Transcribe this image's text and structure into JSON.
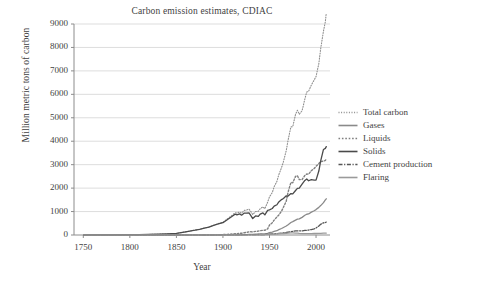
{
  "chart_data": {
    "type": "line",
    "title": "Carbon emission estimates, CDIAC",
    "xlabel": "Year",
    "ylabel": "Million metric tons of carbon",
    "xlim": [
      1740,
      2015
    ],
    "ylim": [
      0,
      9000
    ],
    "grid": "horizontal",
    "legend_position": "right",
    "xticks": [
      "1750",
      "1800",
      "1850",
      "1900",
      "1950",
      "2000"
    ],
    "xtick_values": [
      1750,
      1800,
      1850,
      1900,
      1950,
      2000
    ],
    "yticks": [
      "0",
      "1000",
      "2000",
      "3000",
      "4000",
      "5000",
      "6000",
      "7000",
      "8000",
      "9000"
    ],
    "ytick_values": [
      0,
      1000,
      2000,
      3000,
      4000,
      5000,
      6000,
      7000,
      8000,
      9000
    ],
    "x": [
      1751,
      1760,
      1770,
      1780,
      1790,
      1800,
      1810,
      1820,
      1830,
      1840,
      1850,
      1860,
      1870,
      1875,
      1880,
      1885,
      1890,
      1895,
      1900,
      1905,
      1910,
      1913,
      1915,
      1918,
      1920,
      1923,
      1925,
      1928,
      1930,
      1932,
      1935,
      1938,
      1940,
      1943,
      1945,
      1948,
      1950,
      1953,
      1955,
      1958,
      1960,
      1963,
      1965,
      1968,
      1970,
      1973,
      1975,
      1978,
      1980,
      1982,
      1985,
      1988,
      1990,
      1992,
      1995,
      1998,
      2000,
      2003,
      2005,
      2008,
      2010,
      2011
    ],
    "series": [
      {
        "name": "Total carbon",
        "style": "fine-dotted",
        "color": "#8f8f8f",
        "values": [
          3,
          4,
          6,
          8,
          10,
          12,
          17,
          23,
          31,
          45,
          65,
          135,
          205,
          245,
          295,
          345,
          415,
          485,
          545,
          695,
          845,
          950,
          930,
          980,
          935,
          1050,
          1060,
          1105,
          1000,
          870,
          1000,
          1010,
          1120,
          1200,
          1120,
          1400,
          1630,
          1810,
          2060,
          2290,
          2570,
          2880,
          3130,
          3600,
          4050,
          4610,
          4620,
          5150,
          5320,
          5150,
          5300,
          5800,
          6100,
          6130,
          6400,
          6610,
          6760,
          7310,
          7950,
          8700,
          9100,
          9470
        ]
      },
      {
        "name": "Gases",
        "style": "solid",
        "color": "#8a8a8a",
        "values": [
          0,
          0,
          0,
          0,
          0,
          0,
          0,
          0,
          0,
          0,
          0,
          0,
          0,
          0,
          0,
          0,
          0,
          1,
          2,
          4,
          6,
          8,
          9,
          11,
          13,
          17,
          20,
          25,
          28,
          27,
          32,
          38,
          43,
          51,
          54,
          66,
          97,
          124,
          150,
          182,
          227,
          277,
          321,
          382,
          441,
          534,
          572,
          635,
          676,
          686,
          752,
          840,
          885,
          897,
          975,
          1035,
          1083,
          1178,
          1255,
          1380,
          1495,
          1545
        ]
      },
      {
        "name": "Liquids",
        "style": "dotted",
        "color": "#7f7f7f",
        "values": [
          0,
          0,
          0,
          0,
          0,
          0,
          0,
          0,
          0,
          0,
          0,
          0,
          1,
          2,
          3,
          5,
          9,
          14,
          18,
          28,
          40,
          53,
          58,
          68,
          77,
          98,
          110,
          133,
          142,
          133,
          153,
          167,
          185,
          199,
          200,
          263,
          423,
          525,
          636,
          770,
          849,
          1024,
          1184,
          1444,
          1838,
          2241,
          2231,
          2501,
          2529,
          2362,
          2365,
          2539,
          2601,
          2595,
          2747,
          2835,
          2926,
          3047,
          3135,
          3149,
          3181,
          3237
        ]
      },
      {
        "name": "Solids",
        "style": "solid",
        "color": "#4a4a4a",
        "values": [
          3,
          4,
          6,
          8,
          10,
          12,
          17,
          23,
          31,
          45,
          65,
          135,
          204,
          243,
          292,
          340,
          406,
          471,
          525,
          663,
          799,
          889,
          863,
          901,
          845,
          935,
          930,
          947,
          829,
          700,
          814,
          793,
          891,
          945,
          856,
          1050,
          1070,
          1130,
          1229,
          1290,
          1410,
          1510,
          1560,
          1670,
          1661,
          1768,
          1752,
          1897,
          1987,
          1999,
          2166,
          2328,
          2390,
          2315,
          2363,
          2344,
          2341,
          2728,
          3163,
          3648,
          3693,
          3768
        ]
      },
      {
        "name": "Cement production",
        "style": "dash-dot",
        "color": "#555555",
        "values": [
          0,
          0,
          0,
          0,
          0,
          0,
          0,
          0,
          0,
          0,
          0,
          0,
          0,
          0,
          0,
          0,
          0,
          1,
          2,
          3,
          5,
          7,
          6,
          7,
          9,
          12,
          14,
          17,
          18,
          16,
          18,
          22,
          22,
          20,
          19,
          27,
          33,
          43,
          50,
          59,
          72,
          85,
          93,
          107,
          122,
          146,
          153,
          172,
          180,
          176,
          176,
          194,
          200,
          210,
          231,
          261,
          298,
          384,
          456,
          520,
          529,
          552
        ]
      },
      {
        "name": "Flaring",
        "style": "solid",
        "color": "#9a9a9a",
        "values": [
          0,
          0,
          0,
          0,
          0,
          0,
          0,
          0,
          0,
          0,
          0,
          0,
          0,
          0,
          0,
          0,
          0,
          0,
          0,
          0,
          0,
          0,
          0,
          0,
          0,
          1,
          2,
          3,
          4,
          4,
          6,
          8,
          10,
          12,
          13,
          17,
          23,
          31,
          37,
          44,
          53,
          60,
          65,
          74,
          81,
          94,
          90,
          84,
          79,
          69,
          61,
          60,
          62,
          61,
          62,
          68,
          64,
          68,
          72,
          78,
          83,
          84
        ]
      }
    ]
  },
  "legend": {
    "items": [
      {
        "label": "Total carbon"
      },
      {
        "label": "Gases"
      },
      {
        "label": "Liquids"
      },
      {
        "label": "Solids"
      },
      {
        "label": "Cement production"
      },
      {
        "label": "Flaring"
      }
    ]
  }
}
